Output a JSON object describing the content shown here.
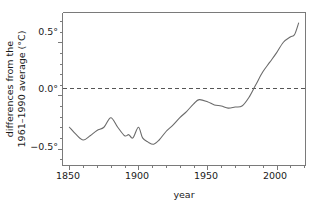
{
  "figure": {
    "background_color": "#ffffff",
    "line_color": "#6b6b6b",
    "axis_color": "#7a7a7a",
    "zero_line_color": "#555555"
  },
  "axis": {
    "ylabel_line1": "differences from the",
    "ylabel_line2": "1961–1990 average (°C)",
    "xlabel": "year",
    "xticks": [
      "1850",
      "1900",
      "1950",
      "2000"
    ],
    "yticks": [
      "0.5°",
      "0.0°",
      "−0.5°"
    ]
  },
  "chart_data": {
    "type": "line",
    "title": "",
    "subtitle": "",
    "xlabel": "year",
    "ylabel": "differences from the 1961–1990 average (°C)",
    "xlim": [
      1845,
      2021
    ],
    "ylim": [
      -0.66,
      0.78
    ],
    "xticks": [
      1850,
      1900,
      1950,
      2000
    ],
    "xtick_labels": [
      "1850",
      "1900",
      "1950",
      "2000"
    ],
    "xminor_tick_interval": 10,
    "yticks": [
      -0.5,
      0.0,
      0.5
    ],
    "ytick_labels": [
      "−0.5°",
      "0.0°",
      "0.5°"
    ],
    "yminor_tick_interval": 0.1,
    "grid": false,
    "legend": "none",
    "annotations": [
      {
        "kind": "horizontal-reference-line",
        "value": 0.0,
        "style": "dashed",
        "label": "1961–1990 average"
      }
    ],
    "series": [
      {
        "name": "global mean temperature anomaly",
        "x": [
          1850,
          1855,
          1860,
          1865,
          1870,
          1875,
          1880,
          1885,
          1890,
          1893,
          1896,
          1900,
          1903,
          1907,
          1911,
          1915,
          1920,
          1925,
          1930,
          1935,
          1940,
          1944,
          1950,
          1955,
          1960,
          1965,
          1970,
          1975,
          1980,
          1985,
          1990,
          1995,
          2000,
          2005,
          2010,
          2013,
          2016
        ],
        "y": [
          -0.3,
          -0.37,
          -0.42,
          -0.38,
          -0.33,
          -0.3,
          -0.21,
          -0.3,
          -0.38,
          -0.37,
          -0.4,
          -0.3,
          -0.4,
          -0.44,
          -0.46,
          -0.42,
          -0.34,
          -0.28,
          -0.21,
          -0.15,
          -0.08,
          -0.04,
          -0.06,
          -0.09,
          -0.1,
          -0.12,
          -0.11,
          -0.1,
          -0.02,
          0.1,
          0.22,
          0.31,
          0.4,
          0.5,
          0.55,
          0.57,
          0.68
        ]
      }
    ]
  }
}
